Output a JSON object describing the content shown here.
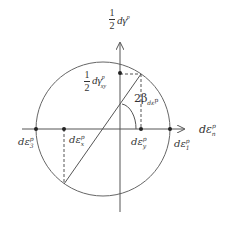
{
  "diagram": {
    "type": "mohr-circle-plastic-strain-increment",
    "colors": {
      "line": "#555555",
      "text": "#333333",
      "background": "#ffffff"
    },
    "labels": {
      "vertical_axis": {
        "numerator": "1",
        "denominator": "2",
        "text": "dγ",
        "sup": "p"
      },
      "shear_point": {
        "numerator": "1",
        "denominator": "2",
        "text": "dγ",
        "sup": "p",
        "sub": "xy"
      },
      "angle": {
        "text": "2β",
        "sub": "dε",
        "sup": "p"
      },
      "horizontal_axis": {
        "text": "dε",
        "sup": "p",
        "sub": "n"
      },
      "eps3": {
        "text": "dε",
        "sup": "p",
        "sub": "3"
      },
      "epsx": {
        "text": "dε",
        "sup": "p",
        "sub": "x"
      },
      "epsy": {
        "text": "dε",
        "sup": "p",
        "sub": "y"
      },
      "eps1": {
        "text": "dε",
        "sup": "p",
        "sub": "1"
      }
    }
  }
}
